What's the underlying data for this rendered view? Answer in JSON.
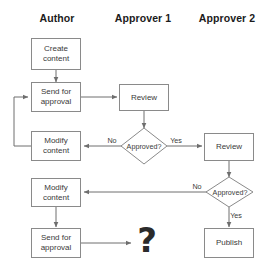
{
  "diagram": {
    "colors": {
      "background": "#ffffff",
      "stroke": "#8a8a8a",
      "connector": "#6e6e6e",
      "text": "#3a3a3a",
      "header_text": "#1b1b1b"
    },
    "lanes": [
      {
        "id": "author",
        "label": "Author"
      },
      {
        "id": "approver1",
        "label": "Approver 1"
      },
      {
        "id": "approver2",
        "label": "Approver 2"
      }
    ],
    "nodes": [
      {
        "id": "create-content",
        "label": "Create\ncontent",
        "shape": "rect",
        "lane": "author"
      },
      {
        "id": "send-for-approval-1",
        "label": "Send for\napproval",
        "shape": "rect",
        "lane": "author"
      },
      {
        "id": "modify-content-1",
        "label": "Modify\ncontent",
        "shape": "rect",
        "lane": "author"
      },
      {
        "id": "modify-content-2",
        "label": "Modify\ncontent",
        "shape": "rect",
        "lane": "author"
      },
      {
        "id": "send-for-approval-2",
        "label": "Send for\napproval",
        "shape": "rect",
        "lane": "author"
      },
      {
        "id": "review-1",
        "label": "Review",
        "shape": "rect",
        "lane": "approver1"
      },
      {
        "id": "approved-1",
        "label": "Approved?",
        "shape": "diamond",
        "lane": "approver1"
      },
      {
        "id": "review-2",
        "label": "Review",
        "shape": "rect",
        "lane": "approver2"
      },
      {
        "id": "approved-2",
        "label": "Approved?",
        "shape": "diamond",
        "lane": "approver2"
      },
      {
        "id": "publish",
        "label": "Publish",
        "shape": "rect",
        "lane": "approver2"
      },
      {
        "id": "unknown-next-step",
        "label": "?",
        "shape": "glyph",
        "lane": "approver1"
      }
    ],
    "edge_labels": {
      "approved1_no": "No",
      "approved1_yes": "Yes",
      "approved2_no": "No",
      "approved2_yes": "Yes"
    }
  }
}
